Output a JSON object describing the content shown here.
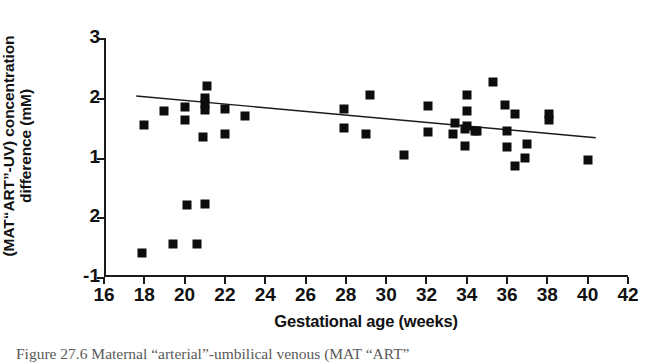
{
  "figure": {
    "caption_partial": "Figure 27.6  Maternal “arterial”-umbilical venous (MAT “ART”"
  },
  "chart_data": {
    "type": "scatter",
    "title": "",
    "xlabel": "Gestational age (weeks)",
    "ylabel_line1": "(MAT“ART”-UV) concentration",
    "ylabel_line2": "difference (mM)",
    "xlim": [
      16,
      42
    ],
    "ylim": [
      3,
      -1
    ],
    "y_axis_inverted": true,
    "grid": false,
    "legend": null,
    "xticks": [
      16,
      18,
      20,
      22,
      24,
      26,
      28,
      30,
      32,
      34,
      36,
      38,
      40,
      42
    ],
    "xtick_labels": [
      "16",
      "18",
      "20",
      "22",
      "24",
      "26",
      "28",
      "30",
      "32",
      "34",
      "36",
      "38",
      "40",
      "42"
    ],
    "yticks": [
      3,
      2,
      1,
      0,
      -1
    ],
    "ytick_labels": [
      "3",
      "2",
      "1",
      "2",
      "-1"
    ],
    "marker": "square",
    "marker_color": "#0d0d0d",
    "marker_size": 9,
    "points": [
      {
        "x": 17.9,
        "y": -0.6
      },
      {
        "x": 18.0,
        "y": 1.55
      },
      {
        "x": 19.0,
        "y": 1.78
      },
      {
        "x": 19.4,
        "y": -0.45
      },
      {
        "x": 20.0,
        "y": 1.62
      },
      {
        "x": 20.0,
        "y": 1.85
      },
      {
        "x": 20.1,
        "y": 0.2
      },
      {
        "x": 20.6,
        "y": -0.45
      },
      {
        "x": 20.9,
        "y": 1.35
      },
      {
        "x": 21.0,
        "y": 1.8
      },
      {
        "x": 21.0,
        "y": 1.9
      },
      {
        "x": 21.0,
        "y": 2.0
      },
      {
        "x": 21.0,
        "y": 0.22
      },
      {
        "x": 21.1,
        "y": 2.2
      },
      {
        "x": 22.0,
        "y": 1.4
      },
      {
        "x": 22.0,
        "y": 1.82
      },
      {
        "x": 23.0,
        "y": 1.7
      },
      {
        "x": 27.9,
        "y": 1.5
      },
      {
        "x": 27.9,
        "y": 1.82
      },
      {
        "x": 29.0,
        "y": 1.4
      },
      {
        "x": 29.2,
        "y": 2.05
      },
      {
        "x": 30.9,
        "y": 1.05
      },
      {
        "x": 32.1,
        "y": 1.43
      },
      {
        "x": 32.1,
        "y": 1.87
      },
      {
        "x": 33.3,
        "y": 1.4
      },
      {
        "x": 33.4,
        "y": 1.57
      },
      {
        "x": 33.9,
        "y": 1.2
      },
      {
        "x": 33.9,
        "y": 1.48
      },
      {
        "x": 34.0,
        "y": 1.52
      },
      {
        "x": 34.0,
        "y": 1.78
      },
      {
        "x": 34.0,
        "y": 2.05
      },
      {
        "x": 34.4,
        "y": 1.44
      },
      {
        "x": 34.5,
        "y": 1.45
      },
      {
        "x": 35.3,
        "y": 2.27
      },
      {
        "x": 35.9,
        "y": 1.88
      },
      {
        "x": 36.0,
        "y": 1.17
      },
      {
        "x": 36.0,
        "y": 1.45
      },
      {
        "x": 36.4,
        "y": 0.85
      },
      {
        "x": 36.4,
        "y": 1.73
      },
      {
        "x": 36.9,
        "y": 1.0
      },
      {
        "x": 37.0,
        "y": 1.23
      },
      {
        "x": 38.1,
        "y": 1.62
      },
      {
        "x": 38.1,
        "y": 1.72
      },
      {
        "x": 40.0,
        "y": 0.95
      }
    ],
    "trendline": {
      "type": "linear-fit",
      "x_start": 17.6,
      "y_start": 2.03,
      "x_end": 40.4,
      "y_end": 1.33,
      "color": "#1a1a1a",
      "width": 1.4
    }
  }
}
